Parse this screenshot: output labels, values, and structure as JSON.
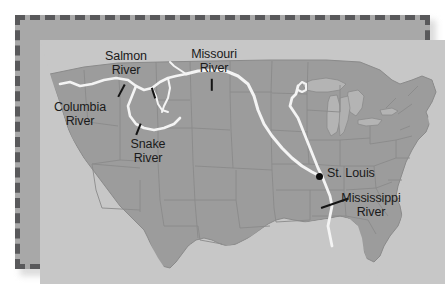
{
  "figure": {
    "type": "reference-map",
    "frame_style": "dashed-border",
    "frame_color": "#59595b",
    "land_color": "#9c9c9c",
    "water_color": "#c9c9c9",
    "river_color": "#f2f2f2",
    "state_border_color": "#878787",
    "label_color": "#1a1a1a",
    "background_color": "#ffffff"
  },
  "labels": [
    {
      "id": "salmon",
      "text": "Salmon\nRiver",
      "align": "center"
    },
    {
      "id": "missouri",
      "text": "Missouri\nRiver",
      "align": "center"
    },
    {
      "id": "columbia",
      "text": "Columbia\nRiver",
      "align": "center"
    },
    {
      "id": "snake",
      "text": "Snake\nRiver",
      "align": "center"
    },
    {
      "id": "mississippi",
      "text": "Mississippi\nRiver",
      "align": "center"
    },
    {
      "id": "stlouis",
      "text": "St. Louis",
      "align": "left"
    }
  ],
  "rivers": [
    {
      "name": "Columbia River"
    },
    {
      "name": "Salmon River"
    },
    {
      "name": "Snake River"
    },
    {
      "name": "Missouri River"
    },
    {
      "name": "Mississippi River"
    }
  ],
  "cities": [
    {
      "name": "St. Louis"
    }
  ]
}
